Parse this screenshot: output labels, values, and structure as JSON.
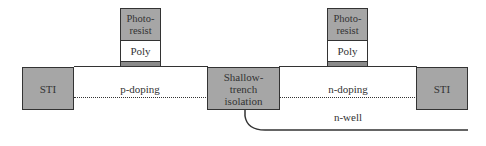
{
  "diagram": {
    "type": "CMOS cross-section (shallow-trench isolation)",
    "left_sti": {
      "label": "STI"
    },
    "middle_sti": {
      "label": "Shallow-trench isolation",
      "lines": [
        "Shallow-",
        "trench",
        "isolation"
      ]
    },
    "right_sti": {
      "label": "STI"
    },
    "left_gate": {
      "photoresist_lines": [
        "Photo-",
        "resist"
      ],
      "poly_label": "Poly"
    },
    "right_gate": {
      "photoresist_lines": [
        "Photo-",
        "resist"
      ],
      "poly_label": "Poly"
    },
    "left_region_label": "p-doping",
    "right_region_label": "n-doping",
    "well_label": "n-well",
    "colors": {
      "sti_fill": "#a6a6a6",
      "resist_fill": "#a6a6a6",
      "oxide_fill": "#8a8a8a",
      "outline": "#333333",
      "background": "#ffffff"
    }
  }
}
